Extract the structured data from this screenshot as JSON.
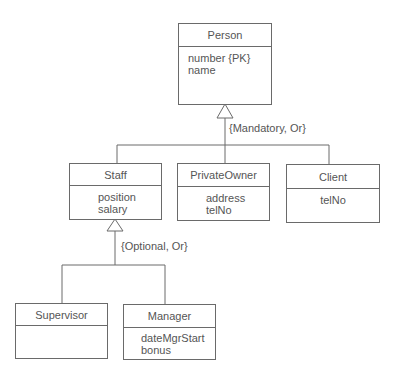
{
  "diagram": {
    "type": "UML class diagram - generalization hierarchy",
    "classes": [
      {
        "id": "person",
        "name": "Person",
        "attributes": [
          "number {PK}",
          "name"
        ]
      },
      {
        "id": "staff",
        "name": "Staff",
        "attributes": [
          "position",
          "salary"
        ]
      },
      {
        "id": "privateowner",
        "name": "PrivateOwner",
        "attributes": [
          "address",
          "telNo"
        ]
      },
      {
        "id": "client",
        "name": "Client",
        "attributes": [
          "telNo"
        ]
      },
      {
        "id": "supervisor",
        "name": "Supervisor",
        "attributes": []
      },
      {
        "id": "manager",
        "name": "Manager",
        "attributes": [
          "dateMgrStart",
          "bonus"
        ]
      }
    ],
    "generalizations": [
      {
        "superclass": "Person",
        "subclasses": [
          "Staff",
          "PrivateOwner",
          "Client"
        ],
        "constraint": "{Mandatory, Or}"
      },
      {
        "superclass": "Staff",
        "subclasses": [
          "Supervisor",
          "Manager"
        ],
        "constraint": "{Optional, Or}"
      }
    ],
    "colors": {
      "line": "#6a6a6a",
      "text": "#555555",
      "background": "#ffffff"
    }
  }
}
